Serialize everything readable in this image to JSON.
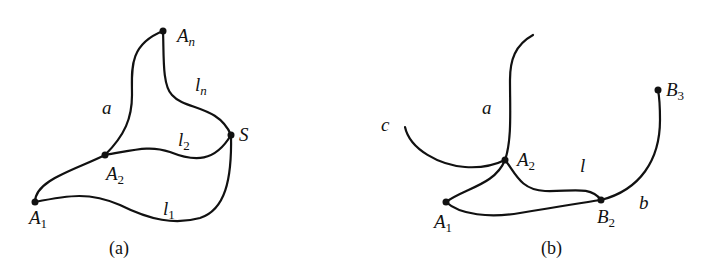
{
  "figure_a": {
    "caption": "(a)",
    "points": {
      "A1": {
        "base": "A",
        "sub": "1"
      },
      "A2": {
        "base": "A",
        "sub": "2"
      },
      "An": {
        "base": "A",
        "sub": "n"
      },
      "S": {
        "base": "S"
      }
    },
    "curve_labels": {
      "a": "a",
      "l1": {
        "base": "l",
        "sub": "1"
      },
      "l2": {
        "base": "l",
        "sub": "2"
      },
      "ln": {
        "base": "l",
        "sub": "n"
      }
    }
  },
  "figure_b": {
    "caption": "(b)",
    "points": {
      "A1": {
        "base": "A",
        "sub": "1"
      },
      "A2": {
        "base": "A",
        "sub": "2"
      },
      "B2": {
        "base": "B",
        "sub": "2"
      },
      "B3": {
        "base": "B",
        "sub": "3"
      }
    },
    "curve_labels": {
      "a": "a",
      "b": "b",
      "c": "c",
      "l": "l"
    }
  },
  "colors": {
    "stroke": "#111111",
    "background": "#ffffff"
  }
}
